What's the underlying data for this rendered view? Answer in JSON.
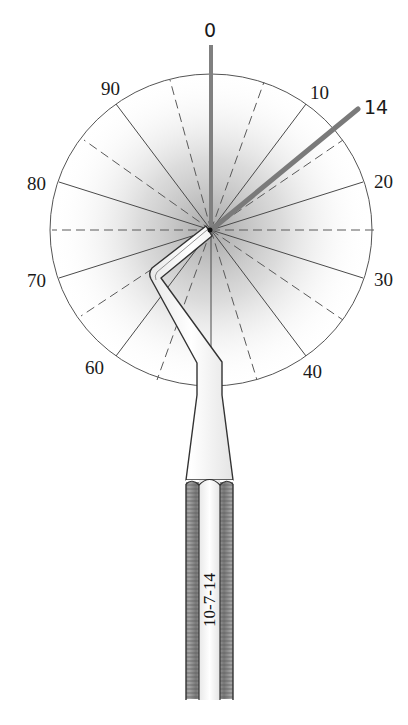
{
  "diagram": {
    "dial": {
      "scale_labels": [
        {
          "text": "0",
          "angle_deg": 0
        },
        {
          "text": "10",
          "angle_deg": 36
        },
        {
          "text": "20",
          "angle_deg": 72
        },
        {
          "text": "30",
          "angle_deg": 108
        },
        {
          "text": "40",
          "angle_deg": 144
        },
        {
          "text": "60",
          "angle_deg": 216
        },
        {
          "text": "70",
          "angle_deg": 252
        },
        {
          "text": "80",
          "angle_deg": 288
        },
        {
          "text": "90",
          "angle_deg": 324
        }
      ],
      "indicated_value": "14",
      "reference_value": "0",
      "label_0": "0",
      "label_10": "10",
      "label_14": "14",
      "label_20": "20",
      "label_30": "30",
      "label_40": "40",
      "label_60": "60",
      "label_70": "70",
      "label_80": "80",
      "label_90": "90"
    },
    "instrument": {
      "handle_marking": "10-7-14"
    },
    "colors": {
      "line": "#444444",
      "indicator_rod": "#7a7a7a",
      "shading": "#9a9a9a",
      "handle_knurl": "#8c8c8c"
    }
  }
}
